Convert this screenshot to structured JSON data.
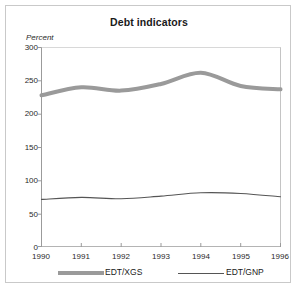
{
  "chart_data": {
    "type": "line",
    "title": "Debt indicators",
    "xlabel": "",
    "ylabel": "Percent",
    "ylim": [
      0,
      300
    ],
    "yticks": [
      0,
      50,
      100,
      150,
      200,
      250,
      300
    ],
    "x": [
      1990,
      1991,
      1992,
      1993,
      1994,
      1995,
      1996
    ],
    "xticklabels": [
      "1990",
      "1991",
      "1992",
      "1993",
      "1994",
      "1995",
      "1996"
    ],
    "grid": false,
    "legend_position": "bottom",
    "series": [
      {
        "name": "EDT/XGS",
        "values": [
          228,
          240,
          235,
          245,
          262,
          242,
          237
        ],
        "color": "#9a9a9a",
        "style": "thick"
      },
      {
        "name": "EDT/GNP",
        "values": [
          71,
          74,
          72,
          76,
          81,
          80,
          75
        ],
        "color": "#555555",
        "style": "thin"
      }
    ]
  },
  "axis": {
    "y_labels": [
      "300",
      "250",
      "200",
      "150",
      "100",
      "50",
      "0"
    ],
    "x_labels": [
      "1990",
      "1991",
      "1992",
      "1993",
      "1994",
      "1995",
      "1996"
    ],
    "y_axis_caption": "Percent"
  },
  "legend": {
    "items": [
      {
        "label": "EDT/XGS",
        "swatch": "thick-gray-line-swatch"
      },
      {
        "label": "EDT/GNP",
        "swatch": "thin-dark-line-swatch"
      }
    ]
  },
  "colors": {
    "series_xgs": "#9a9a9a",
    "series_gnp": "#555555",
    "axis": "#9b9b9b",
    "frame": "#c9c9c9",
    "text": "#1a1a1a",
    "background": "#ffffff"
  }
}
